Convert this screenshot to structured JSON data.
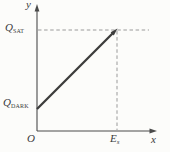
{
  "figure": {
    "colors": {
      "axis": "#4a4a4a",
      "line": "#3c3c3c",
      "dashed": "#9a9a9a",
      "text": "#3a3a3a",
      "background": "#fcfcfa"
    },
    "labels": {
      "y_axis": "y",
      "x_axis": "x",
      "origin": "O",
      "q_sat_main": "Q",
      "q_sat_sub": "SAT",
      "q_dark_main": "Q",
      "q_dark_sub": "DARK",
      "e_s_main": "E",
      "e_s_sub": "s"
    },
    "elements": {
      "line": "straight line with arrow tip from (0, Q_DARK) on the y-axis up to the point (E_s, Q_SAT)",
      "dashed_guides": [
        "horizontal dashed line at the Q_SAT level, from the y-axis past the line tip",
        "vertical dashed line at E_s, from the line tip down to the x-axis"
      ]
    }
  }
}
